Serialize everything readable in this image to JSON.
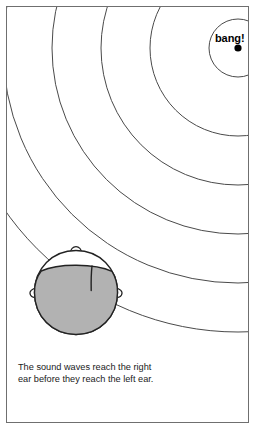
{
  "figure": {
    "name": "sound-waves-reaching-ears-diagram",
    "background_color": "#ffffff",
    "frame_color": "#6f6f6f",
    "wave_stroke_color": "#4a4a4a",
    "hair_fill_color": "#b2b2b2",
    "outline_color": "#222222",
    "source": {
      "label": "bang!",
      "dot_color": "#000000"
    },
    "caption": {
      "line1": "The sound waves reach the right",
      "line2": "ear before they reach the left ear."
    },
    "parts": {
      "head_outline": "head-outline",
      "hair": "hair-shape",
      "hair_part": "hair-part-line",
      "left_ear": "left-ear",
      "right_ear": "right-ear",
      "nose": "nose"
    },
    "wave_count": 6
  }
}
